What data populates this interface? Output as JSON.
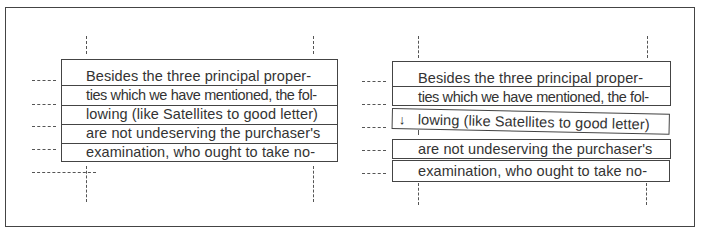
{
  "figure": {
    "panels": [
      {
        "id": "left",
        "label": "aligned",
        "lines": [
          "Besides the three principal proper-",
          "ties which we have mentioned, the fol-",
          "lowing (like Satellites to good letter)",
          "are not undeserving the purchaser's",
          "examination, who ought to take no-"
        ]
      },
      {
        "id": "right",
        "label": "misaligned",
        "lines": [
          "Besides the three principal proper-",
          "ties which we have mentioned, the fol-",
          "lowing (like Satellites to good letter)",
          "are not undeserving the purchaser's",
          "examination, who ought to take no-"
        ],
        "marker": "↓"
      }
    ],
    "colors": {
      "ink": "#333333",
      "border": "#444444",
      "background": "#ffffff"
    }
  }
}
